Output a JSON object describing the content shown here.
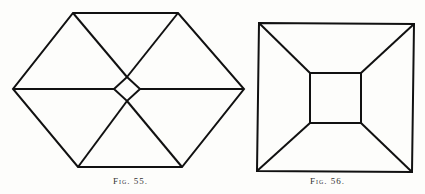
{
  "figures": [
    {
      "id": "fig55",
      "caption": "Fig. 55.",
      "shape": "hexagon divided into six triangles around a small central diamond",
      "outer_polygon": [
        [
          73,
          13
        ],
        [
          178,
          13
        ],
        [
          244,
          89
        ],
        [
          182,
          167
        ],
        [
          78,
          167
        ],
        [
          13,
          89
        ]
      ],
      "inner_diamond": [
        [
          127,
          77
        ],
        [
          140,
          89
        ],
        [
          127,
          101
        ],
        [
          114,
          89
        ]
      ],
      "spokes": [
        [
          [
            73,
            13
          ],
          [
            127,
            77
          ]
        ],
        [
          [
            178,
            13
          ],
          [
            127,
            77
          ]
        ],
        [
          [
            244,
            89
          ],
          [
            140,
            89
          ]
        ],
        [
          [
            182,
            167
          ],
          [
            127,
            101
          ]
        ],
        [
          [
            78,
            167
          ],
          [
            127,
            101
          ]
        ],
        [
          [
            13,
            89
          ],
          [
            114,
            89
          ]
        ]
      ],
      "stroke_color": "#111111"
    },
    {
      "id": "fig56",
      "caption": "Fig. 56.",
      "shape": "square with inner square connected by corner diagonals",
      "outer_polygon": [
        [
          259,
          23
        ],
        [
          414,
          24
        ],
        [
          412,
          172
        ],
        [
          257,
          171
        ]
      ],
      "inner_polygon": [
        [
          310,
          73
        ],
        [
          361,
          73
        ],
        [
          361,
          123
        ],
        [
          310,
          123
        ]
      ],
      "spokes": [
        [
          [
            259,
            23
          ],
          [
            310,
            73
          ]
        ],
        [
          [
            414,
            24
          ],
          [
            361,
            73
          ]
        ],
        [
          [
            412,
            172
          ],
          [
            361,
            123
          ]
        ],
        [
          [
            257,
            171
          ],
          [
            310,
            123
          ]
        ]
      ],
      "stroke_color": "#111111"
    }
  ]
}
